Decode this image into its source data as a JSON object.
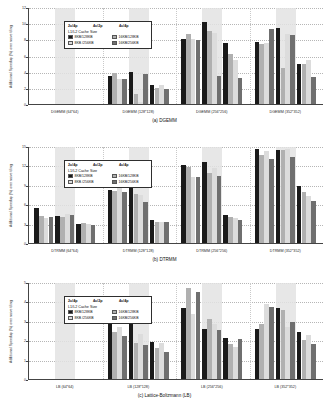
{
  "figure": {
    "width": 329,
    "height": 417
  },
  "legend": {
    "group_headers": [
      "2c/4p",
      "4c/2p",
      "4c/4p"
    ],
    "title": "L1/L2 Cache Size",
    "series": [
      {
        "label": "8KB/128KB",
        "color": "#1a1a1a"
      },
      {
        "label": "16KB/128KB",
        "color": "#b0b0b0"
      },
      {
        "label": "8KB /256KB",
        "color": "#dcdcdc"
      },
      {
        "label": "16KB/256KB",
        "color": "#6f6f6f"
      }
    ]
  },
  "colors": {
    "series": [
      "#1a1a1a",
      "#b0b0b0",
      "#dcdcdc",
      "#6f6f6f"
    ],
    "band": "#e3e3e3",
    "axis": "#444444",
    "grid": "#b6b6b6"
  },
  "chart_data": [
    {
      "type": "bar",
      "title": "(a) DGEMM",
      "xlabel": "",
      "ylabel": "Additional Speedup (%) over naive tiling",
      "ylim": [
        0,
        12
      ],
      "yticks": [
        0,
        2,
        4,
        6,
        8,
        10,
        12
      ],
      "grid": true,
      "legend_position": "upper-left",
      "categories": [
        "DGEMM (64*64)",
        "DGEMM (128*128)",
        "DGEMM (256*256)",
        "DGEMM (352*352)"
      ],
      "config_groups": [
        "2c/4p",
        "4c/2p",
        "4c/4p"
      ],
      "series": [
        {
          "name": "8KB/128KB",
          "values": [
            [
              0,
              0,
              0
            ],
            [
              3.5,
              4.0,
              2.4
            ],
            [
              8.1,
              10.2,
              7.5
            ],
            [
              7.7,
              9.4,
              5.0
            ]
          ]
        },
        {
          "name": "16KB/128KB",
          "values": [
            [
              0,
              0,
              0
            ],
            [
              3.8,
              1.2,
              2.0
            ],
            [
              8.7,
              9.0,
              6.2
            ],
            [
              7.4,
              4.4,
              5.0
            ]
          ]
        },
        {
          "name": "8KB /256KB",
          "values": [
            [
              0,
              0,
              0
            ],
            [
              3.1,
              0.3,
              2.3
            ],
            [
              8.0,
              8.8,
              5.4
            ],
            [
              7.5,
              8.6,
              5.4
            ]
          ]
        },
        {
          "name": "16KB/256KB",
          "values": [
            [
              0,
              0,
              0
            ],
            [
              3.1,
              3.7,
              1.8
            ],
            [
              7.9,
              3.5,
              3.2
            ],
            [
              9.3,
              8.5,
              3.4
            ]
          ]
        }
      ]
    },
    {
      "type": "bar",
      "title": "(b) DTRMM",
      "xlabel": "",
      "ylabel": "Additional Speedup (%) over naive tiling",
      "ylim": [
        0,
        15
      ],
      "yticks": [
        0,
        3,
        6,
        9,
        12,
        15
      ],
      "grid": true,
      "legend_position": "upper-left",
      "categories": [
        "DTRMM (64*64)",
        "DTRMM (128*128)",
        "DTRMM (256*256)",
        "DTRMM (352*352)"
      ],
      "config_groups": [
        "2c/4p",
        "4c/2p",
        "4c/4p"
      ],
      "series": [
        {
          "name": "8KB/128KB",
          "values": [
            [
              5.4,
              4.2,
              3.0
            ],
            [
              8.2,
              8.7,
              3.5
            ],
            [
              12.0,
              12.6,
              4.3
            ],
            [
              14.5,
              14.4,
              8.8
            ]
          ]
        },
        {
          "name": "16KB/128KB",
          "values": [
            [
              4.2,
              4.1,
              3.1
            ],
            [
              8.1,
              7.6,
              3.3
            ],
            [
              11.7,
              10.9,
              4.0
            ],
            [
              13.6,
              14.4,
              7.9
            ]
          ]
        },
        {
          "name": "8KB /256KB",
          "values": [
            [
              3.9,
              4.5,
              2.9
            ],
            [
              8.5,
              7.5,
              3.3
            ],
            [
              10.2,
              11.6,
              3.9
            ],
            [
              14.2,
              14.5,
              7.3
            ]
          ]
        },
        {
          "name": "16KB/256KB",
          "values": [
            [
              4.0,
              4.4,
              2.8
            ],
            [
              7.9,
              6.4,
              3.2
            ],
            [
              10.2,
              10.3,
              3.6
            ],
            [
              13.0,
              13.3,
              6.5
            ]
          ]
        }
      ]
    },
    {
      "type": "bar",
      "title": "(c) Lattice-Boltzmann (LB)",
      "xlabel": "",
      "ylabel": "Additional Speedup (%) over naive tiling",
      "ylim": [
        0,
        5
      ],
      "yticks": [
        0,
        1,
        2,
        3,
        4,
        5
      ],
      "grid": true,
      "legend_position": "upper-left",
      "categories": [
        "LB (64*64)",
        "LB (128*128)",
        "LB (256*256)",
        "LB (352*352)"
      ],
      "config_groups": [
        "2c/4p",
        "4c/2p",
        "4c/4p"
      ],
      "series": [
        {
          "name": "8KB/128KB",
          "values": [
            [
              0,
              0,
              0
            ],
            [
              3.0,
              2.9,
              1.9
            ],
            [
              3.65,
              2.6,
              2.1
            ],
            [
              2.6,
              3.65,
              2.4
            ]
          ]
        },
        {
          "name": "16KB/128KB",
          "values": [
            [
              0,
              0,
              0
            ],
            [
              2.4,
              1.85,
              1.6
            ],
            [
              4.7,
              3.1,
              1.8
            ],
            [
              2.85,
              3.55,
              2.0
            ]
          ]
        },
        {
          "name": "8KB /256KB",
          "values": [
            [
              0,
              0,
              0
            ],
            [
              2.7,
              2.3,
              1.85
            ],
            [
              3.35,
              2.85,
              1.65
            ],
            [
              3.85,
              2.7,
              2.25
            ]
          ]
        },
        {
          "name": "16KB/256KB",
          "values": [
            [
              0,
              0,
              0
            ],
            [
              2.2,
              1.75,
              1.4
            ],
            [
              4.5,
              2.55,
              2.05
            ],
            [
              3.7,
              2.95,
              1.8
            ]
          ]
        }
      ]
    }
  ]
}
